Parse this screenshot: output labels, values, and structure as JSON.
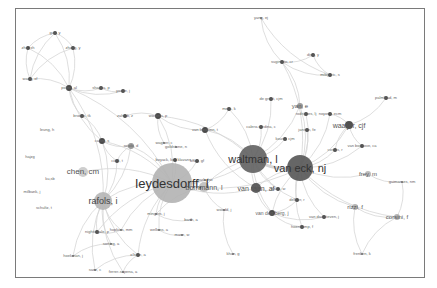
{
  "diagram": {
    "type": "co-authorship network",
    "edge_color": "#d6d6d6",
    "node_color_large": "#a9a9a9",
    "node_color_dark": "#4a4a4a",
    "nodes": [
      {
        "id": "leydesdorff",
        "label": "leydesdorff, l",
        "x": 172,
        "y": 183,
        "r": 20,
        "size": 13,
        "color": "#b3b3b3",
        "fc": "#333"
      },
      {
        "id": "waltman",
        "label": "waltman, l",
        "x": 253,
        "y": 159,
        "r": 14,
        "size": 11,
        "color": "#616161",
        "fc": "#333"
      },
      {
        "id": "vaneck",
        "label": "van eck, nj",
        "x": 300,
        "y": 168,
        "r": 13,
        "size": 11,
        "color": "#555555",
        "fc": "#333"
      },
      {
        "id": "rafols",
        "label": "rafols, i",
        "x": 103,
        "y": 201,
        "r": 9,
        "size": 9,
        "color": "#b5b5b5",
        "fc": "#444"
      },
      {
        "id": "chen",
        "label": "chen, cm",
        "x": 83,
        "y": 172,
        "r": 5,
        "size": 8,
        "color": "#c9c9c9",
        "fc": "#555"
      },
      {
        "id": "bornmann",
        "label": "bornmann, l",
        "x": 204,
        "y": 187,
        "r": 5,
        "size": 7,
        "color": "#bdbdbd",
        "fc": "#555"
      },
      {
        "id": "vanraan",
        "label": "van raan, af",
        "x": 256,
        "y": 188,
        "r": 5,
        "size": 7,
        "color": "#4f4f4f",
        "fc": "#555"
      },
      {
        "id": "waaijer",
        "label": "waaijer, cjf",
        "x": 349,
        "y": 125,
        "r": 4,
        "size": 7,
        "color": "#4f4f4f",
        "fc": "#555"
      },
      {
        "id": "yan",
        "label": "yan, e",
        "x": 300,
        "y": 106,
        "r": 3,
        "size": 6,
        "color": "#9a9a9a",
        "fc": "#555"
      },
      {
        "id": "frey",
        "label": "frey, m",
        "x": 368,
        "y": 174,
        "r": 3,
        "size": 6,
        "color": "#bdbdbd",
        "fc": "#555"
      },
      {
        "id": "rizzi",
        "label": "rizzi, f",
        "x": 355,
        "y": 207,
        "r": 3,
        "size": 6,
        "color": "#b5b5b5",
        "fc": "#555"
      },
      {
        "id": "corsini",
        "label": "corsini, f",
        "x": 397,
        "y": 217,
        "r": 3,
        "size": 6,
        "color": "#b5b5b5",
        "fc": "#555"
      },
      {
        "id": "vandenberg",
        "label": "van den berg, j",
        "x": 272,
        "y": 213,
        "r": 3,
        "size": 5,
        "color": "#4a4a4a",
        "fc": "#666"
      },
      {
        "id": "wouters",
        "label": "wouters, p",
        "x": 158,
        "y": 116,
        "r": 3,
        "size": 4,
        "color": "#4a4a4a",
        "fc": "#666"
      },
      {
        "id": "vanleeuwen",
        "label": "van leeuwen, t",
        "x": 205,
        "y": 130,
        "r": 3,
        "size": 4,
        "color": "#4a4a4a",
        "fc": "#666"
      },
      {
        "id": "carley",
        "label": "carley, s",
        "x": 102,
        "y": 141,
        "r": 3,
        "size": 4,
        "color": "#4a4a4a",
        "fc": "#666"
      },
      {
        "id": "rotolo",
        "label": "rotolo, d",
        "x": 131,
        "y": 146,
        "r": 3,
        "size": 4,
        "color": "#9a9a9a",
        "fc": "#666"
      },
      {
        "id": "porter",
        "label": "porter, al",
        "x": 69,
        "y": 88,
        "r": 3,
        "size": 4,
        "color": "#4a4a4a",
        "fc": "#666"
      },
      {
        "id": "zhang",
        "label": "zhang, y",
        "x": 73,
        "y": 48,
        "r": 2,
        "size": 4,
        "color": "#4a4a4a",
        "fc": "#666"
      },
      {
        "id": "guo",
        "label": "guo, y",
        "x": 55,
        "y": 33,
        "r": 2,
        "size": 4,
        "color": "#4a4a4a",
        "fc": "#666"
      },
      {
        "id": "zhuxh",
        "label": "zhu, xh",
        "x": 28,
        "y": 48,
        "r": 2,
        "size": 4,
        "color": "#4a4a4a",
        "fc": "#666"
      },
      {
        "id": "wang",
        "label": "wang, xf",
        "x": 30,
        "y": 79,
        "r": 2,
        "size": 4,
        "color": "#4a4a4a",
        "fc": "#666"
      },
      {
        "id": "shapira",
        "label": "shapira, p",
        "x": 101,
        "y": 88,
        "r": 2,
        "size": 4,
        "color": "#4a4a4a",
        "fc": "#666"
      },
      {
        "id": "youtie",
        "label": "youtie, j",
        "x": 123,
        "y": 91,
        "r": 2,
        "size": 4,
        "color": "#4a4a4a",
        "fc": "#666"
      },
      {
        "id": "zahedi",
        "label": "zahedi, z",
        "x": 125,
        "y": 116,
        "r": 2,
        "size": 4,
        "color": "#4a4a4a",
        "fc": "#666"
      },
      {
        "id": "brooks",
        "label": "brooks, tk",
        "x": 82,
        "y": 116,
        "r": 2,
        "size": 4,
        "color": "#4a4a4a",
        "fc": "#666"
      },
      {
        "id": "ciarli",
        "label": "ciarli, t",
        "x": 117,
        "y": 161,
        "r": 2,
        "size": 4,
        "color": "#4a4a4a",
        "fc": "#666"
      },
      {
        "id": "klavans",
        "label": "boyack, kw; klavans, r",
        "x": 175,
        "y": 160,
        "r": 2,
        "size": 4,
        "color": "#4a4a4a",
        "fc": "#666"
      },
      {
        "id": "wagner",
        "label": "wagner, c",
        "x": 164,
        "y": 143,
        "r": 1,
        "size": 4,
        "color": "#777",
        "fc": "#666"
      },
      {
        "id": "goldstone",
        "label": "goldstone, n",
        "x": 176,
        "y": 147,
        "r": 1,
        "size": 4,
        "color": "#777",
        "fc": "#666"
      },
      {
        "id": "khan",
        "label": "khan, gf",
        "x": 197,
        "y": 161,
        "r": 2,
        "size": 4,
        "color": "#4a4a4a",
        "fc": "#666"
      },
      {
        "id": "degroot",
        "label": "de groot, cjm",
        "x": 271,
        "y": 99,
        "r": 2,
        "size": 4,
        "color": "#4a4a4a",
        "fc": "#666"
      },
      {
        "id": "melis",
        "label": "melis, k",
        "x": 229,
        "y": 109,
        "r": 2,
        "size": 4,
        "color": "#4a4a4a",
        "fc": "#666"
      },
      {
        "id": "rodrigues",
        "label": "rodrigues, lj",
        "x": 306,
        "y": 114,
        "r": 2,
        "size": 4,
        "color": "#4a4a4a",
        "fc": "#666"
      },
      {
        "id": "noyons",
        "label": "noyons, ecm",
        "x": 330,
        "y": 114,
        "r": 2,
        "size": 4,
        "color": "#4a4a4a",
        "fc": "#666"
      },
      {
        "id": "jansen",
        "label": "jansen, fe",
        "x": 307,
        "y": 130,
        "r": 2,
        "size": 4,
        "color": "#4a4a4a",
        "fc": "#666"
      },
      {
        "id": "kousa",
        "label": "kousa, cjm",
        "x": 285,
        "y": 139,
        "r": 2,
        "size": 4,
        "color": "#4a4a4a",
        "fc": "#666"
      },
      {
        "id": "calero",
        "label": "calero-medina, c",
        "x": 261,
        "y": 127,
        "r": 2,
        "size": 4,
        "color": "#4a4a4a",
        "fc": "#666"
      },
      {
        "id": "vanbochove",
        "label": "van bochove, ca",
        "x": 362,
        "y": 146,
        "r": 2,
        "size": 4,
        "color": "#4a4a4a",
        "fc": "#666"
      },
      {
        "id": "costas",
        "label": "costas, r",
        "x": 335,
        "y": 150,
        "r": 2,
        "size": 4,
        "color": "#4a4a4a",
        "fc": "#666"
      },
      {
        "id": "palmblad",
        "label": "palmblad, m",
        "x": 386,
        "y": 98,
        "r": 2,
        "size": 4,
        "color": "#4a4a4a",
        "fc": "#666"
      },
      {
        "id": "guimaraes",
        "label": "guimaraes, nm",
        "x": 402,
        "y": 182,
        "r": 1,
        "size": 4,
        "color": "#777",
        "fc": "#666"
      },
      {
        "id": "yang",
        "label": "yang, ej",
        "x": 261,
        "y": 18,
        "r": 1,
        "size": 4,
        "color": "#777",
        "fc": "#666"
      },
      {
        "id": "sugimoto",
        "label": "sugimoto, cr",
        "x": 282,
        "y": 62,
        "r": 2,
        "size": 4,
        "color": "#4a4a4a",
        "fc": "#666"
      },
      {
        "id": "ding",
        "label": "ding, y",
        "x": 313,
        "y": 55,
        "r": 2,
        "size": 4,
        "color": "#4a4a4a",
        "fc": "#666"
      },
      {
        "id": "milojevic",
        "label": "milojevic, s",
        "x": 330,
        "y": 75,
        "r": 2,
        "size": 4,
        "color": "#4a4a4a",
        "fc": "#666"
      },
      {
        "id": "leung",
        "label": "leung, h",
        "x": 47,
        "y": 130,
        "r": 0,
        "size": 4,
        "color": "#777",
        "fc": "#666"
      },
      {
        "id": "hajzg",
        "label": "hajzg",
        "x": 30,
        "y": 157,
        "r": 0,
        "size": 4,
        "color": "#777",
        "fc": "#666"
      },
      {
        "id": "kusb",
        "label": "ku,sb",
        "x": 50,
        "y": 179,
        "r": 0,
        "size": 4,
        "color": "#777",
        "fc": "#666"
      },
      {
        "id": "milbank",
        "label": "milbank, j",
        "x": 32,
        "y": 192,
        "r": 0,
        "size": 4,
        "color": "#777",
        "fc": "#666"
      },
      {
        "id": "schultz",
        "label": "schultz, t",
        "x": 44,
        "y": 208,
        "r": 0,
        "size": 4,
        "color": "#777",
        "fc": "#666"
      },
      {
        "id": "nightingale",
        "label": "nightingale, p",
        "x": 97,
        "y": 232,
        "r": 2,
        "size": 4,
        "color": "#4a4a4a",
        "fc": "#666"
      },
      {
        "id": "hopkins",
        "label": "hopkins, mm",
        "x": 121,
        "y": 230,
        "r": 1,
        "size": 4,
        "color": "#777",
        "fc": "#666"
      },
      {
        "id": "sorting",
        "label": "sorting, a",
        "x": 111,
        "y": 244,
        "r": 1,
        "size": 4,
        "color": "#777",
        "fc": "#666"
      },
      {
        "id": "hoekman",
        "label": "hoekman, j",
        "x": 73,
        "y": 256,
        "r": 1,
        "size": 4,
        "color": "#777",
        "fc": "#666"
      },
      {
        "id": "ohare",
        "label": "o'hare, a",
        "x": 138,
        "y": 255,
        "r": 2,
        "size": 4,
        "color": "#4a4a4a",
        "fc": "#666"
      },
      {
        "id": "saez",
        "label": "saez, c",
        "x": 95,
        "y": 270,
        "r": 1,
        "size": 4,
        "color": "#777",
        "fc": "#666"
      },
      {
        "id": "ferrer",
        "label": "ferrer-sapena, a",
        "x": 123,
        "y": 272,
        "r": 1,
        "size": 4,
        "color": "#777",
        "fc": "#666"
      },
      {
        "id": "mingers",
        "label": "mingers, j",
        "x": 156,
        "y": 214,
        "r": 1,
        "size": 4,
        "color": "#777",
        "fc": "#666"
      },
      {
        "id": "barth",
        "label": "barth, a",
        "x": 191,
        "y": 220,
        "r": 1,
        "size": 4,
        "color": "#777",
        "fc": "#666"
      },
      {
        "id": "wellens",
        "label": "wellens, a",
        "x": 159,
        "y": 230,
        "r": 1,
        "size": 4,
        "color": "#777",
        "fc": "#666"
      },
      {
        "id": "mase",
        "label": "mase, w",
        "x": 182,
        "y": 235,
        "r": 1,
        "size": 4,
        "color": "#777",
        "fc": "#666"
      },
      {
        "id": "park",
        "label": "park, hw",
        "x": 205,
        "y": 180,
        "r": 1,
        "size": 4,
        "color": "#777",
        "fc": "#666"
      },
      {
        "id": "wood",
        "label": "woodd, j",
        "x": 224,
        "y": 210,
        "r": 1,
        "size": 4,
        "color": "#777",
        "fc": "#666"
      },
      {
        "id": "khan2",
        "label": "khan, g",
        "x": 233,
        "y": 254,
        "r": 1,
        "size": 4,
        "color": "#777",
        "fc": "#666"
      },
      {
        "id": "dekker",
        "label": "dekker, r",
        "x": 297,
        "y": 200,
        "r": 2,
        "size": 4,
        "color": "#4a4a4a",
        "fc": "#666"
      },
      {
        "id": "vandaalen",
        "label": "van daalsteven, j",
        "x": 324,
        "y": 217,
        "r": 2,
        "size": 4,
        "color": "#4a4a4a",
        "fc": "#666"
      },
      {
        "id": "hoenkamp",
        "label": "hoenkamp, f",
        "x": 302,
        "y": 227,
        "r": 2,
        "size": 4,
        "color": "#4a4a4a",
        "fc": "#666"
      },
      {
        "id": "pelegrin",
        "label": "jones, w",
        "x": 278,
        "y": 189,
        "r": 2,
        "size": 4,
        "color": "#4a4a4a",
        "fc": "#666"
      },
      {
        "id": "frenken",
        "label": "frenken, k",
        "x": 362,
        "y": 254,
        "r": 1,
        "size": 4,
        "color": "#777",
        "fc": "#666"
      }
    ],
    "edges": [
      [
        "leydesdorff",
        "waltman"
      ],
      [
        "leydesdorff",
        "vaneck"
      ],
      [
        "leydesdorff",
        "rafols"
      ],
      [
        "leydesdorff",
        "bornmann"
      ],
      [
        "leydesdorff",
        "chen"
      ],
      [
        "leydesdorff",
        "carley"
      ],
      [
        "leydesdorff",
        "rotolo"
      ],
      [
        "leydesdorff",
        "wouters"
      ],
      [
        "leydesdorff",
        "porter"
      ],
      [
        "leydesdorff",
        "klavans"
      ],
      [
        "leydesdorff",
        "nightingale"
      ],
      [
        "leydesdorff",
        "mingers"
      ],
      [
        "leydesdorff",
        "ohare"
      ],
      [
        "leydesdorff",
        "park"
      ],
      [
        "leydesdorff",
        "vanraan"
      ],
      [
        "leydesdorff",
        "khan"
      ],
      [
        "leydesdorff",
        "wellens"
      ],
      [
        "leydesdorff",
        "hopkins"
      ],
      [
        "waltman",
        "vaneck"
      ],
      [
        "waltman",
        "vanraan"
      ],
      [
        "waltman",
        "vanleeuwen"
      ],
      [
        "waltman",
        "yan"
      ],
      [
        "waltman",
        "calero"
      ],
      [
        "waltman",
        "melis"
      ],
      [
        "waltman",
        "degroot"
      ],
      [
        "waltman",
        "kousa"
      ],
      [
        "waltman",
        "bornmann"
      ],
      [
        "waltman",
        "vandenberg"
      ],
      [
        "waltman",
        "wouters"
      ],
      [
        "waltman",
        "pelegrin"
      ],
      [
        "waltman",
        "dekker"
      ],
      [
        "vaneck",
        "waaijer"
      ],
      [
        "vaneck",
        "vanraan"
      ],
      [
        "vaneck",
        "jansen"
      ],
      [
        "vaneck",
        "noyons"
      ],
      [
        "vaneck",
        "rodrigues"
      ],
      [
        "vaneck",
        "costas"
      ],
      [
        "vaneck",
        "frey"
      ],
      [
        "vaneck",
        "rizzi"
      ],
      [
        "vaneck",
        "vandenberg"
      ],
      [
        "vaneck",
        "dekker"
      ],
      [
        "vaneck",
        "vandaalen"
      ],
      [
        "vaneck",
        "hoenkamp"
      ],
      [
        "vaneck",
        "yan"
      ],
      [
        "vaneck",
        "sugimoto"
      ],
      [
        "vaneck",
        "vanbochove"
      ],
      [
        "vaneck",
        "corsini"
      ],
      [
        "waaijer",
        "palmblad"
      ],
      [
        "waaijer",
        "vanbochove"
      ],
      [
        "waaijer",
        "noyons"
      ],
      [
        "waaijer",
        "costas"
      ],
      [
        "rizzi",
        "corsini"
      ],
      [
        "rizzi",
        "frenken"
      ],
      [
        "corsini",
        "frenken"
      ],
      [
        "frey",
        "guimaraes"
      ],
      [
        "corsini",
        "guimaraes"
      ],
      [
        "yan",
        "sugimoto"
      ],
      [
        "sugimoto",
        "ding"
      ],
      [
        "sugimoto",
        "milojevic"
      ],
      [
        "yang",
        "milojevic"
      ],
      [
        "yang",
        "sugimoto"
      ],
      [
        "ding",
        "milojevic"
      ],
      [
        "rafols",
        "carley"
      ],
      [
        "rafols",
        "porter"
      ],
      [
        "rafols",
        "nightingale"
      ],
      [
        "rafols",
        "hopkins"
      ],
      [
        "rafols",
        "sorting"
      ],
      [
        "rafols",
        "hoekman"
      ],
      [
        "rafols",
        "ohare"
      ],
      [
        "rafols",
        "rotolo"
      ],
      [
        "rafols",
        "ciarli"
      ],
      [
        "rafols",
        "saez"
      ],
      [
        "rafols",
        "ferrer"
      ],
      [
        "porter",
        "zhang"
      ],
      [
        "porter",
        "guo"
      ],
      [
        "porter",
        "zhuxh"
      ],
      [
        "porter",
        "wang"
      ],
      [
        "porter",
        "shapira"
      ],
      [
        "porter",
        "youtie"
      ],
      [
        "porter",
        "carley"
      ],
      [
        "porter",
        "brooks"
      ],
      [
        "zhang",
        "guo"
      ],
      [
        "guo",
        "zhuxh"
      ],
      [
        "zhuxh",
        "wang"
      ],
      [
        "zhang",
        "wang"
      ],
      [
        "guo",
        "wang"
      ],
      [
        "shapira",
        "youtie"
      ],
      [
        "carley",
        "rotolo"
      ],
      [
        "carley",
        "ciarli"
      ],
      [
        "carley",
        "brooks"
      ],
      [
        "rotolo",
        "ciarli"
      ],
      [
        "wouters",
        "zahedi"
      ],
      [
        "wouters",
        "vanleeuwen"
      ],
      [
        "wouters",
        "wagner"
      ],
      [
        "vanleeuwen",
        "melis"
      ],
      [
        "vanleeuwen",
        "vanraan"
      ],
      [
        "vanraan",
        "vandenberg"
      ],
      [
        "vanraan",
        "pelegrin"
      ],
      [
        "vandenberg",
        "hoenkamp"
      ],
      [
        "vandenberg",
        "dekker"
      ],
      [
        "vandenberg",
        "vandaalen"
      ],
      [
        "bornmann",
        "mingers"
      ],
      [
        "bornmann",
        "wood"
      ],
      [
        "ohare",
        "saez"
      ],
      [
        "ohare",
        "ferrer"
      ],
      [
        "sorting",
        "hoekman"
      ],
      [
        "nightingale",
        "hopkins"
      ],
      [
        "wood",
        "khan2"
      ],
      [
        "mingers",
        "barth"
      ],
      [
        "wellens",
        "mase"
      ]
    ]
  }
}
